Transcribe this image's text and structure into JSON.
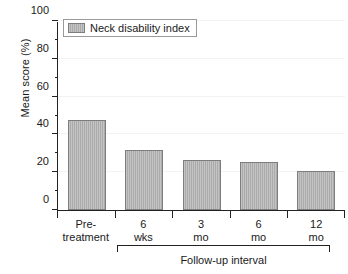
{
  "chart_data": {
    "type": "bar",
    "title": "",
    "xlabel": "Follow-up interval",
    "ylabel": "Mean score (%)",
    "categories": [
      "Pre-treatment",
      "6 wks",
      "3 mo",
      "6 mo",
      "12 mo"
    ],
    "category_lines": [
      [
        "Pre-",
        "treatment"
      ],
      [
        "6",
        "wks"
      ],
      [
        "3",
        "mo"
      ],
      [
        "6",
        "mo"
      ],
      [
        "12",
        "mo"
      ]
    ],
    "values": [
      47.5,
      31.7,
      26.5,
      25.4,
      20.6
    ],
    "series": [
      {
        "name": "Neck disability index",
        "values": [
          47.5,
          31.7,
          26.5,
          25.4,
          20.6
        ]
      }
    ],
    "ylim": [
      0,
      100
    ],
    "ytick_labels": [
      "0",
      "20",
      "40",
      "60",
      "80",
      "100"
    ],
    "ytick_values": [
      0,
      20,
      40,
      60,
      80,
      100
    ],
    "yminor_values": [
      10,
      30,
      50,
      70,
      90
    ],
    "grid": true,
    "legend_position": "top-left",
    "bar_color": "#ababab",
    "bar_edge_color": "#7d7d7d",
    "axis_color": "#222222",
    "annotations": [
      {
        "type": "bracket",
        "label": "Follow-up interval",
        "spans": [
          "6 wks",
          "3 mo",
          "6 mo",
          "12 mo"
        ]
      }
    ]
  },
  "legend": {
    "entries": [
      {
        "label": "Neck disability index",
        "color": "#ababab"
      }
    ]
  },
  "axes": {
    "y_title": "Mean score (%)",
    "x_group_title": "Follow-up interval"
  }
}
